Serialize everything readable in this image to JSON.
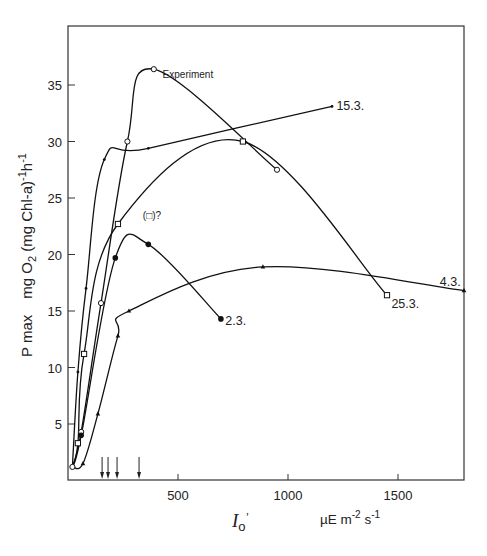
{
  "chart_data": {
    "type": "line",
    "title": "",
    "xlabel": "I_o'   µE m-2 s-1",
    "xlabel_symbol": "Io'",
    "xlabel_unit": "µE m-2 s-1",
    "ylabel": "P max   mg O2 (mg Chl-a)-1 h-1",
    "ylabel_prefix": "P max",
    "ylabel_unit": "mg O2 (mg Chl-a)-1h-1",
    "xlim": [
      0,
      1800
    ],
    "ylim": [
      0,
      39
    ],
    "x_ticks": [
      500,
      1000,
      1500
    ],
    "y_ticks": [
      5,
      10,
      15,
      20,
      25,
      30,
      35
    ],
    "grid": false,
    "legend": "inline labels",
    "series": [
      {
        "name": "Experiment",
        "marker": "open-circle",
        "x": [
          20,
          60,
          150,
          270,
          390,
          950
        ],
        "y": [
          1.2,
          4.3,
          15.7,
          30.0,
          36.4,
          27.5
        ]
      },
      {
        "name": "15.3.",
        "marker": "asterisk",
        "x": [
          20,
          45,
          82,
          165,
          365,
          1200
        ],
        "y": [
          1.2,
          9.6,
          17.0,
          28.4,
          29.4,
          33.1
        ]
      },
      {
        "name": "25.3.",
        "marker": "open-square",
        "x": [
          20,
          45,
          73,
          227,
          795,
          1450
        ],
        "y": [
          1.2,
          3.3,
          11.2,
          22.7,
          30.0,
          16.4
        ]
      },
      {
        "name": "2.3.",
        "marker": "filled-circle",
        "x": [
          20,
          60,
          215,
          365,
          695
        ],
        "y": [
          1.2,
          4.0,
          19.7,
          20.9,
          14.3
        ]
      },
      {
        "name": "4.3.",
        "marker": "filled-triangle",
        "x": [
          20,
          68,
          136,
          227,
          277,
          886,
          1800
        ],
        "y": [
          1.2,
          1.5,
          5.9,
          12.8,
          15.0,
          18.9,
          16.8
        ]
      }
    ],
    "annotations": [
      {
        "text": "Experiment",
        "x": 430,
        "y": 36.0
      },
      {
        "text": "(□)?",
        "x": 340,
        "y": 23.5
      },
      {
        "text": "15.3.",
        "x": 1220,
        "y": 33.1
      },
      {
        "text": "25.3.",
        "x": 1470,
        "y": 15.6
      },
      {
        "text": "2.3.",
        "x": 715,
        "y": 14.1
      },
      {
        "text": "4.3.",
        "x": 1690,
        "y": 17.6
      }
    ],
    "arrows_on_x_axis": [
      155,
      182,
      223,
      323
    ]
  },
  "labels": {
    "y_prefix": "P max",
    "y_unit_a": "mg O",
    "y_unit_sub": "2",
    "y_unit_b": " (mg Chl-a)",
    "y_unit_sup1": "-1",
    "y_unit_c": "h",
    "y_unit_sup2": "-1",
    "x_symbol": "I",
    "x_symbol_sub": "o",
    "x_symbol_prime": "'",
    "x_unit_a": "µE m",
    "x_unit_sup1": "-2",
    "x_unit_b": " s",
    "x_unit_sup2": "-1"
  }
}
